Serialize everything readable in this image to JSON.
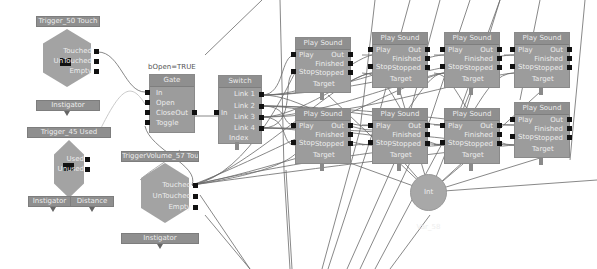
{
  "events": [
    {
      "id": "trigger_touch_a",
      "title": "Trigger_50 Touch",
      "outputs": [
        "Touched",
        "UnTouched",
        "Empty"
      ],
      "links": [
        "Instigator"
      ]
    },
    {
      "id": "trigger_used",
      "title": "Trigger_45 Used",
      "outputs": [
        "Used",
        "Unused"
      ],
      "links": [
        "Instigator",
        "Distance"
      ]
    },
    {
      "id": "trigger_volume_touch",
      "title": "TriggerVolume_57 Touch",
      "outputs": [
        "Touched",
        "UnTouched",
        "Empty"
      ],
      "links": [
        "Instigator"
      ]
    }
  ],
  "gate": {
    "annotation": "bOpen=TRUE",
    "title": "Gate",
    "inputs": [
      "In",
      "Open",
      "Close",
      "Toggle"
    ],
    "outputs": [
      "Out"
    ]
  },
  "switch": {
    "title": "Switch",
    "inputs": [
      "In"
    ],
    "outputs": [
      "Link 1",
      "Link 2",
      "Link 3",
      "Link 4"
    ],
    "links": [
      "Index"
    ]
  },
  "play_sound": {
    "title": "Play Sound",
    "inputs": [
      "Play",
      "Stop"
    ],
    "outputs": [
      "Out",
      "Finished",
      "Stopped"
    ],
    "links": [
      "Target"
    ],
    "count": 8
  },
  "variable": {
    "label": "Int Var_58"
  }
}
